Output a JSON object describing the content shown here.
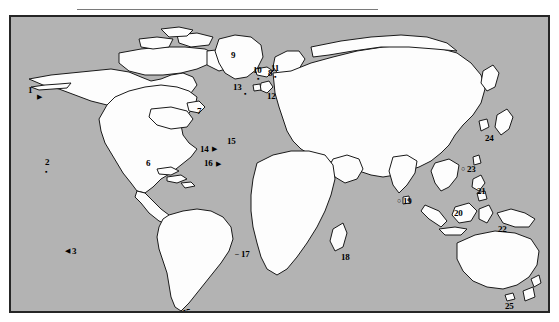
{
  "figure": {
    "type": "world-map",
    "colors": {
      "ocean": "#b3b3b3",
      "land": "#fdfdfd",
      "coastline": "#1a1a1a",
      "frame": "#262626",
      "rule": "#7a7a7a",
      "label": "#000000"
    },
    "rule": {
      "present": true
    },
    "frame": {
      "present": true
    }
  },
  "map": {
    "labels": [
      {
        "id": "1",
        "text": "1",
        "x": 17,
        "y": 69,
        "marker": "arrow-right",
        "mx": 26,
        "my": 76
      },
      {
        "id": "2",
        "text": "2",
        "x": 34,
        "y": 141,
        "marker": "dot",
        "mx": 34,
        "my": 151
      },
      {
        "id": "3",
        "text": "3",
        "x": 61,
        "y": 230,
        "marker": "arrow-left",
        "mx": 54,
        "my": 230
      },
      {
        "id": "4",
        "text": "4",
        "x": 152,
        "y": 303,
        "marker": "none",
        "mx": 0,
        "my": 0
      },
      {
        "id": "5",
        "text": "5",
        "x": 175,
        "y": 291,
        "marker": "arrow-left",
        "mx": 169,
        "my": 291
      },
      {
        "id": "6",
        "text": "6",
        "x": 135,
        "y": 142,
        "marker": "none",
        "mx": 0,
        "my": 0
      },
      {
        "id": "7",
        "text": "7",
        "x": 186,
        "y": 90,
        "marker": "none",
        "mx": 0,
        "my": 0
      },
      {
        "id": "8",
        "text": "8",
        "x": 257,
        "y": 52,
        "marker": "none",
        "mx": 0,
        "my": 0
      },
      {
        "id": "9",
        "text": "9",
        "x": 220,
        "y": 34,
        "marker": "none",
        "mx": 0,
        "my": 0
      },
      {
        "id": "10",
        "text": "10",
        "x": 242,
        "y": 49,
        "marker": "dot",
        "mx": 246,
        "my": 58
      },
      {
        "id": "11",
        "text": "11",
        "x": 260,
        "y": 47,
        "marker": "dot",
        "mx": 263,
        "my": 56
      },
      {
        "id": "12",
        "text": "12",
        "x": 256,
        "y": 75,
        "marker": "none",
        "mx": 0,
        "my": 0
      },
      {
        "id": "13",
        "text": "13",
        "x": 222,
        "y": 66,
        "marker": "dot",
        "mx": 233,
        "my": 73
      },
      {
        "id": "14",
        "text": "14",
        "x": 189,
        "y": 128,
        "marker": "arrow-right",
        "mx": 201,
        "my": 128
      },
      {
        "id": "15",
        "text": "15",
        "x": 216,
        "y": 120,
        "marker": "none",
        "mx": 0,
        "my": 0
      },
      {
        "id": "16",
        "text": "16",
        "x": 193,
        "y": 142,
        "marker": "arrow-right",
        "mx": 205,
        "my": 143
      },
      {
        "id": "17",
        "text": "17",
        "x": 230,
        "y": 233,
        "marker": "dash-left",
        "mx": 224,
        "my": 233
      },
      {
        "id": "18",
        "text": "18",
        "x": 330,
        "y": 236,
        "marker": "none",
        "mx": 0,
        "my": 0
      },
      {
        "id": "19",
        "text": "19",
        "x": 392,
        "y": 180,
        "marker": "circle",
        "mx": 386,
        "my": 180
      },
      {
        "id": "20",
        "text": "20",
        "x": 443,
        "y": 192,
        "marker": "none",
        "mx": 0,
        "my": 0
      },
      {
        "id": "21",
        "text": "21",
        "x": 466,
        "y": 170,
        "marker": "none",
        "mx": 0,
        "my": 0
      },
      {
        "id": "22",
        "text": "22",
        "x": 487,
        "y": 208,
        "marker": "none",
        "mx": 0,
        "my": 0
      },
      {
        "id": "23",
        "text": "23",
        "x": 456,
        "y": 148,
        "marker": "circle",
        "mx": 450,
        "my": 148
      },
      {
        "id": "24",
        "text": "24",
        "x": 474,
        "y": 117,
        "marker": "none",
        "mx": 0,
        "my": 0
      },
      {
        "id": "25",
        "text": "25",
        "x": 494,
        "y": 285,
        "marker": "none",
        "mx": 0,
        "my": 0
      }
    ]
  }
}
